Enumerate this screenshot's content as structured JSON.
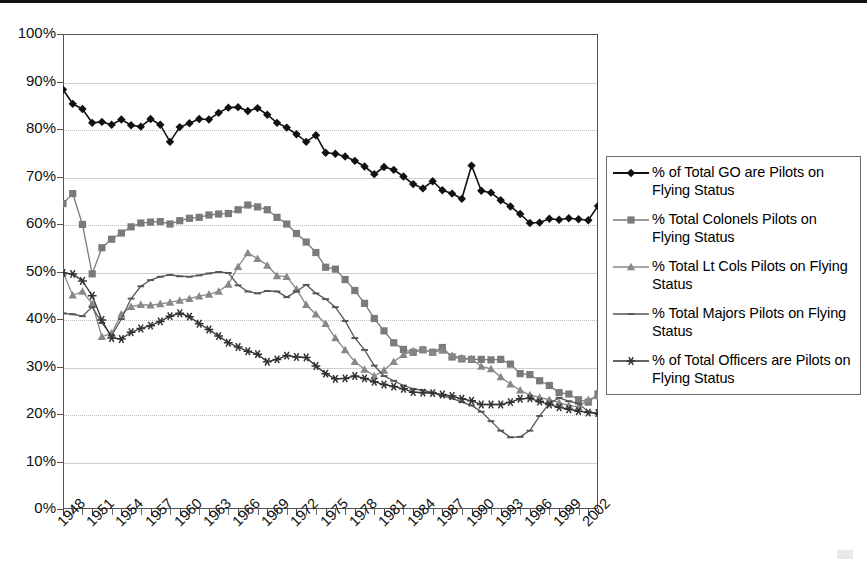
{
  "chart_data": {
    "type": "line",
    "title": "",
    "xlabel": "",
    "ylabel": "",
    "ylim": [
      0,
      100
    ],
    "y_ticks": [
      "0%",
      "10%",
      "20%",
      "30%",
      "40%",
      "50%",
      "60%",
      "70%",
      "80%",
      "90%",
      "100%"
    ],
    "grid": true,
    "legend_position": "right",
    "x_tick_labels": [
      "1948",
      "1951",
      "1954",
      "1957",
      "1960",
      "1963",
      "1966",
      "1969",
      "1972",
      "1975",
      "1978",
      "1981",
      "1984",
      "1987",
      "1990",
      "1993",
      "1996",
      "1999",
      "2002"
    ],
    "x_start": 1948,
    "x_end": 2003,
    "x": [
      1948,
      1949,
      1950,
      1951,
      1952,
      1953,
      1954,
      1955,
      1956,
      1957,
      1958,
      1959,
      1960,
      1961,
      1962,
      1963,
      1964,
      1965,
      1966,
      1967,
      1968,
      1969,
      1970,
      1971,
      1972,
      1973,
      1974,
      1975,
      1976,
      1977,
      1978,
      1979,
      1980,
      1981,
      1982,
      1983,
      1984,
      1985,
      1986,
      1987,
      1988,
      1989,
      1990,
      1991,
      1992,
      1993,
      1994,
      1995,
      1996,
      1997,
      1998,
      1999,
      2000,
      2001,
      2002,
      2003
    ],
    "series": [
      {
        "name": "% of Total GO are Pilots on Flying Status",
        "marker": "diamond",
        "color": "#111111",
        "values": [
          88.3,
          85.3,
          84.2,
          81.3,
          81.5,
          80.9,
          82.0,
          80.8,
          80.5,
          82.1,
          80.9,
          77.3,
          80.4,
          81.2,
          82.1,
          82.0,
          83.4,
          84.5,
          84.6,
          83.8,
          84.4,
          83.0,
          81.3,
          80.3,
          78.9,
          77.3,
          78.7,
          75.0,
          74.8,
          74.2,
          73.3,
          72.1,
          70.5,
          72.0,
          71.4,
          70.0,
          68.4,
          67.5,
          69.0,
          67.1,
          66.4,
          65.3,
          72.3,
          67.0,
          66.6,
          65.0,
          63.7,
          62.1,
          60.2,
          60.3,
          61.1,
          60.9,
          61.2,
          61.0,
          60.8,
          63.8
        ]
      },
      {
        "name": "% Total Colonels Pilots on Flying Status",
        "marker": "square",
        "color": "#7a7a7a",
        "values": [
          64.3,
          66.4,
          59.9,
          49.5,
          55.0,
          56.8,
          58.1,
          59.4,
          60.2,
          60.4,
          60.5,
          60.0,
          60.7,
          61.2,
          61.4,
          61.9,
          62.1,
          62.2,
          63.0,
          64.0,
          63.6,
          63.0,
          61.4,
          60.0,
          58.0,
          56.2,
          54.0,
          50.9,
          50.5,
          48.3,
          46.0,
          43.3,
          40.1,
          37.5,
          35.0,
          33.6,
          33.0,
          33.5,
          33.0,
          34.0,
          32.0,
          31.6,
          31.5,
          31.5,
          31.4,
          31.5,
          30.5,
          28.5,
          28.3,
          27.0,
          26.0,
          24.5,
          24.2,
          23.0,
          22.5,
          24.2
        ]
      },
      {
        "name": "% Total Lt Cols Pilots on Flying Status",
        "marker": "triangle",
        "color": "#888888",
        "values": [
          49.8,
          45.0,
          45.8,
          43.2,
          36.3,
          37.0,
          41.0,
          42.6,
          43.0,
          42.9,
          43.2,
          43.5,
          43.9,
          44.3,
          44.8,
          45.2,
          45.8,
          47.3,
          51.0,
          53.9,
          52.7,
          51.3,
          49.1,
          48.9,
          46.3,
          43.0,
          41.0,
          39.0,
          36.0,
          33.5,
          31.0,
          29.4,
          28.0,
          29.2,
          31.0,
          32.5,
          33.3,
          33.6,
          33.0,
          33.4,
          32.3,
          31.8,
          31.6,
          30.0,
          29.5,
          27.8,
          26.3,
          25.0,
          24.0,
          23.5,
          23.0,
          22.4,
          21.8,
          21.5,
          23.0,
          23.8
        ]
      },
      {
        "name": "% Total Majors Pilots on Flying Status",
        "marker": "dash",
        "color": "#555555",
        "values": [
          41.2,
          41.0,
          40.6,
          42.5,
          39.2,
          36.5,
          40.0,
          44.3,
          46.9,
          48.2,
          48.9,
          49.3,
          49.0,
          48.9,
          49.2,
          49.6,
          49.9,
          49.7,
          47.1,
          45.8,
          45.4,
          45.9,
          45.8,
          44.6,
          45.8,
          47.2,
          45.4,
          44.2,
          42.5,
          39.6,
          36.0,
          33.5,
          30.2,
          28.0,
          27.0,
          26.0,
          25.3,
          25.0,
          24.5,
          23.8,
          23.3,
          22.5,
          21.8,
          20.5,
          18.5,
          16.5,
          15.1,
          15.2,
          16.5,
          19.6,
          22.2,
          23.4,
          22.7,
          22.2,
          20.5,
          20.0
        ]
      },
      {
        "name": "% of Total Officers are Pilots on Flying Status",
        "marker": "star",
        "color": "#333333",
        "values": [
          49.7,
          49.5,
          48.0,
          44.9,
          39.8,
          36.0,
          35.8,
          37.2,
          38.0,
          38.6,
          39.5,
          40.6,
          41.2,
          40.5,
          39.0,
          37.8,
          36.4,
          35.0,
          34.1,
          33.2,
          32.6,
          31.0,
          31.5,
          32.3,
          32.0,
          31.9,
          30.1,
          28.5,
          27.4,
          27.5,
          28.0,
          27.5,
          26.8,
          26.2,
          25.8,
          25.3,
          24.6,
          24.5,
          24.4,
          24.1,
          23.8,
          23.2,
          22.8,
          22.0,
          22.0,
          22.0,
          22.5,
          23.2,
          23.3,
          22.6,
          22.0,
          21.4,
          21.0,
          20.6,
          20.3,
          20.2
        ]
      }
    ]
  },
  "legend": {
    "items": [
      {
        "label": "% of Total GO are Pilots on Flying Status",
        "marker": "diamond-marker-icon"
      },
      {
        "label": "% Total Colonels Pilots on Flying Status",
        "marker": "square-marker-icon"
      },
      {
        "label": "% Total Lt Cols Pilots on Flying Status",
        "marker": "triangle-marker-icon"
      },
      {
        "label": "% Total Majors Pilots on Flying Status",
        "marker": "dash-marker-icon"
      },
      {
        "label": "% of Total Officers are Pilots on Flying Status",
        "marker": "star-marker-icon"
      }
    ]
  },
  "colors": {
    "go": "#111111",
    "colonels": "#7a7a7a",
    "ltcols": "#888888",
    "majors": "#555555",
    "officers": "#333333",
    "grid": "#cfcfcf",
    "frame": "#555555"
  }
}
